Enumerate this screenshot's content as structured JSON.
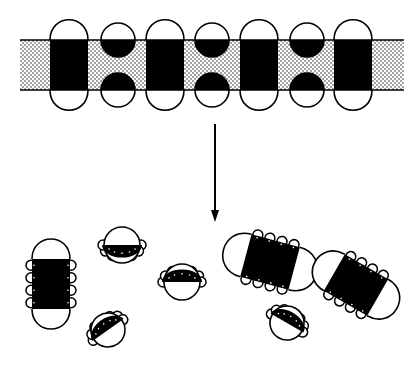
{
  "colors": {
    "ink": "#000000",
    "paper": "#ffffff",
    "stipple": "#000000"
  },
  "membrane": {
    "x": 20,
    "y": 40,
    "width": 384,
    "height": 50,
    "stipple_spacing": 4,
    "units": [
      {
        "type": "cylinder",
        "cx": 69,
        "width": 38
      },
      {
        "type": "pair",
        "cx": 118,
        "r": 17
      },
      {
        "type": "cylinder",
        "cx": 165,
        "width": 38
      },
      {
        "type": "pair",
        "cx": 212,
        "r": 17
      },
      {
        "type": "cylinder",
        "cx": 259,
        "width": 38
      },
      {
        "type": "pair",
        "cx": 307,
        "r": 17
      },
      {
        "type": "cylinder",
        "cx": 353,
        "width": 38
      }
    ],
    "cap_height": 20
  },
  "arrow": {
    "x": 215,
    "y1": 124,
    "y2": 222,
    "direction": "down"
  },
  "aggregates": [
    {
      "type": "rect-mixed",
      "cx": 51,
      "cy": 284,
      "w": 38,
      "h": 50,
      "rotate": 0,
      "loops_per_side": 4
    },
    {
      "type": "half-mixed",
      "cx": 122,
      "cy": 245,
      "r": 18,
      "rotate": 0,
      "loops": 7
    },
    {
      "type": "half-mixed",
      "cx": 182,
      "cy": 282,
      "r": 18,
      "rotate": 180,
      "loops": 7
    },
    {
      "type": "half-mixed",
      "cx": 108,
      "cy": 330,
      "r": 17,
      "rotate": 145,
      "loops": 7
    },
    {
      "type": "rect-mixed",
      "cx": 270,
      "cy": 262,
      "w": 44,
      "h": 50,
      "rotate": -75,
      "loops_per_side": 4
    },
    {
      "type": "half-mixed",
      "cx": 287,
      "cy": 323,
      "r": 17,
      "rotate": 210,
      "loops": 7
    },
    {
      "type": "rect-mixed",
      "cx": 356,
      "cy": 285,
      "w": 42,
      "h": 50,
      "rotate": -60,
      "loops_per_side": 4
    }
  ]
}
